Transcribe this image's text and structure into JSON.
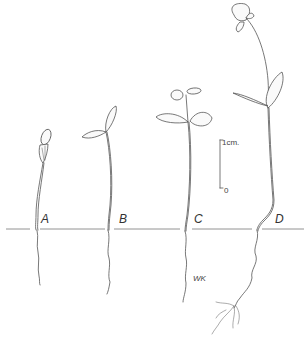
{
  "figure": {
    "stages": [
      {
        "id": "A",
        "label": "A"
      },
      {
        "id": "B",
        "label": "B"
      },
      {
        "id": "C",
        "label": "C"
      },
      {
        "id": "D",
        "label": "D"
      }
    ],
    "scale_bar": {
      "top_label": "1cm.",
      "bottom_label": "0"
    },
    "signature": "WK",
    "colors": {
      "ink": "#555555",
      "background": "#ffffff"
    }
  }
}
